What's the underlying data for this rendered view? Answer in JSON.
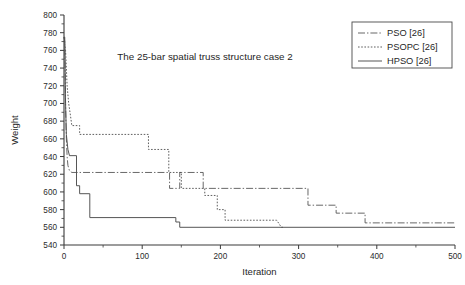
{
  "chart_data": {
    "type": "line",
    "title": "The 25-bar spatial truss structure case 2",
    "xlabel": "Iteration",
    "ylabel": "Weight",
    "xlim": [
      0,
      500
    ],
    "ylim": [
      540,
      800
    ],
    "xticks": [
      0,
      100,
      200,
      300,
      400,
      500
    ],
    "yticks": [
      540,
      560,
      580,
      600,
      620,
      640,
      660,
      680,
      700,
      720,
      740,
      760,
      780,
      800
    ],
    "xtick_labels": [
      "0",
      "100",
      "200",
      "300",
      "400",
      "500"
    ],
    "ytick_labels": [
      "540",
      "560",
      "580",
      "600",
      "620",
      "640",
      "660",
      "680",
      "700",
      "720",
      "740",
      "760",
      "780",
      "800"
    ],
    "x_minor_tick_step": 50,
    "y_minor_tick_step": 10,
    "grid": false,
    "legend_position": "top-right",
    "series": [
      {
        "name": "PSO [26]",
        "style": "dash-dot",
        "color": "#4d4d4d",
        "points": [
          [
            0,
            775
          ],
          [
            1,
            775
          ],
          [
            2,
            700
          ],
          [
            3,
            660
          ],
          [
            4,
            640
          ],
          [
            5,
            630
          ],
          [
            7,
            624
          ],
          [
            10,
            622
          ],
          [
            135,
            622
          ],
          [
            135,
            604
          ],
          [
            148,
            604
          ],
          [
            148,
            622
          ],
          [
            178,
            622
          ],
          [
            178,
            604
          ],
          [
            312,
            604
          ],
          [
            312,
            585
          ],
          [
            348,
            585
          ],
          [
            348,
            576
          ],
          [
            385,
            576
          ],
          [
            385,
            565
          ],
          [
            500,
            565
          ]
        ]
      },
      {
        "name": "PSOPC [26]",
        "style": "dotted",
        "color": "#4d4d4d",
        "points": [
          [
            0,
            775
          ],
          [
            2,
            760
          ],
          [
            4,
            720
          ],
          [
            6,
            700
          ],
          [
            8,
            688
          ],
          [
            10,
            675
          ],
          [
            20,
            675
          ],
          [
            20,
            665
          ],
          [
            108,
            665
          ],
          [
            108,
            648
          ],
          [
            134,
            648
          ],
          [
            134,
            622
          ],
          [
            150,
            622
          ],
          [
            150,
            604
          ],
          [
            180,
            604
          ],
          [
            180,
            596
          ],
          [
            196,
            596
          ],
          [
            196,
            580
          ],
          [
            206,
            580
          ],
          [
            206,
            568
          ],
          [
            272,
            568
          ],
          [
            278,
            560
          ],
          [
            280,
            560
          ]
        ]
      },
      {
        "name": "HPSO [26]",
        "style": "solid",
        "color": "#4d4d4d",
        "points": [
          [
            0,
            775
          ],
          [
            1,
            770
          ],
          [
            2,
            700
          ],
          [
            3,
            665
          ],
          [
            5,
            648
          ],
          [
            7,
            641
          ],
          [
            16,
            641
          ],
          [
            16,
            607
          ],
          [
            20,
            607
          ],
          [
            20,
            598
          ],
          [
            33,
            598
          ],
          [
            33,
            571
          ],
          [
            143,
            571
          ],
          [
            143,
            566
          ],
          [
            148,
            566
          ],
          [
            148,
            560
          ],
          [
            500,
            560
          ]
        ]
      }
    ]
  },
  "legend": {
    "items": [
      {
        "label": "PSO [26]",
        "style": "dash-dot"
      },
      {
        "label": "PSOPC [26]",
        "style": "dotted"
      },
      {
        "label": "HPSO [26]",
        "style": "solid"
      }
    ]
  }
}
